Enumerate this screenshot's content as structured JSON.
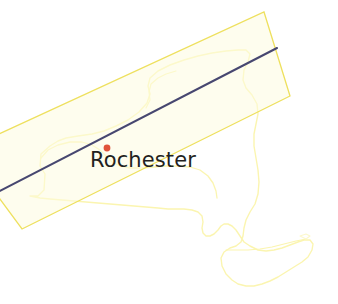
{
  "figure": {
    "kind": "map",
    "width": 338,
    "height": 304,
    "background_color": "#ffffff"
  },
  "basemap": {
    "name": "New York State outline",
    "stroke_color": "#fbf5b0",
    "stroke_width": 1.4
  },
  "swath": {
    "name": "Rotated rectangular map swath",
    "stroke_color": "#eee05e",
    "fill_color": "#fdfbe0",
    "stroke_width": 1.3,
    "corners": "(-36,150) (264,12) (290,96) (22,229)"
  },
  "track": {
    "name": "Ground track centerline",
    "stroke_color": "#474770",
    "stroke_width": 2.1,
    "start": "(-4,193)",
    "end": "(276,49)"
  },
  "city": {
    "name": "Rochester",
    "label": "Rochester",
    "label_color": "#231f20",
    "marker_color": "#e0533a",
    "marker_radius": 3.4,
    "marker_x": 107,
    "marker_y": 148,
    "label_x": 90,
    "label_y": 150
  }
}
